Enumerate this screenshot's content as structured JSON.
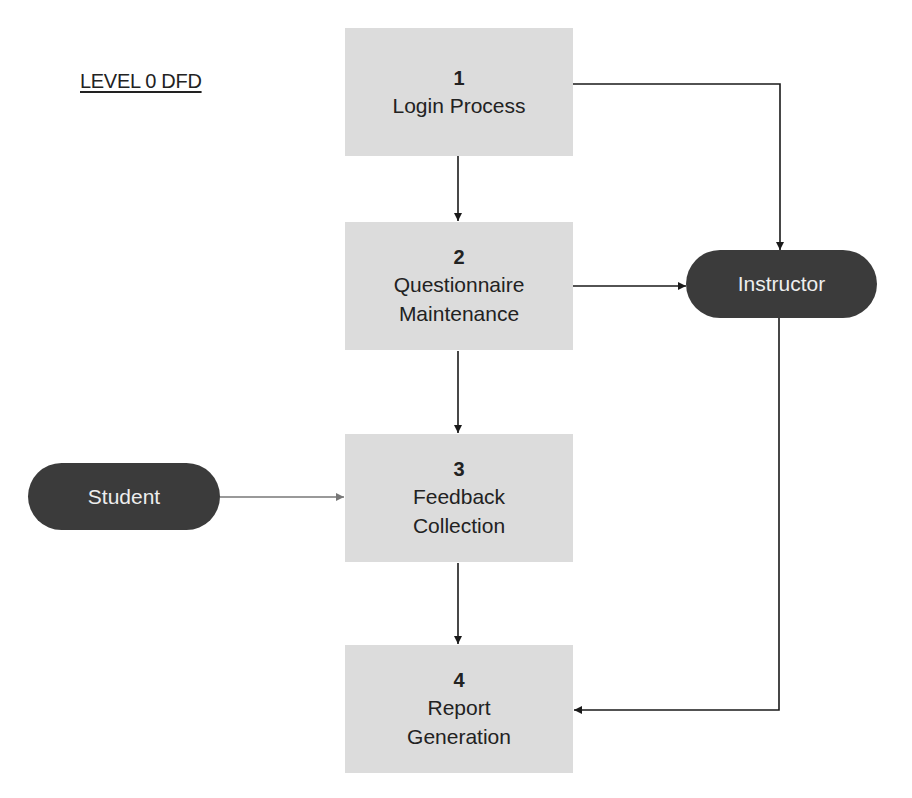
{
  "diagram": {
    "title": "LEVEL 0 DFD",
    "processes": [
      {
        "id": "p1",
        "number": "1",
        "label_lines": [
          "Login Process"
        ]
      },
      {
        "id": "p2",
        "number": "2",
        "label_lines": [
          "Questionnaire",
          "Maintenance"
        ]
      },
      {
        "id": "p3",
        "number": "3",
        "label_lines": [
          "Feedback",
          "Collection"
        ]
      },
      {
        "id": "p4",
        "number": "4",
        "label_lines": [
          "Report",
          "Generation"
        ]
      }
    ],
    "entities": [
      {
        "id": "instructor",
        "label": "Instructor"
      },
      {
        "id": "student",
        "label": "Student"
      }
    ],
    "flows": [
      {
        "from": "p1",
        "to": "p2"
      },
      {
        "from": "p1",
        "to": "instructor"
      },
      {
        "from": "p2",
        "to": "instructor"
      },
      {
        "from": "p2",
        "to": "p3"
      },
      {
        "from": "student",
        "to": "p3"
      },
      {
        "from": "p3",
        "to": "p4"
      },
      {
        "from": "instructor",
        "to": "p4"
      }
    ],
    "colors": {
      "process_fill": "#dcdcdc",
      "entity_fill": "#3b3b3b",
      "entity_text": "#eeeeee",
      "line": "#1a1a1a",
      "student_line": "#777777"
    }
  }
}
